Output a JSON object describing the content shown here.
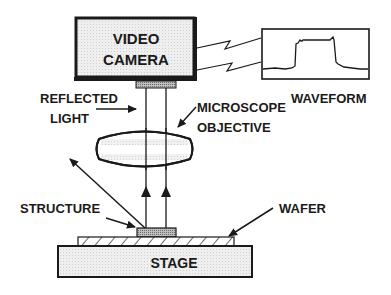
{
  "diagram": {
    "components": {
      "camera": {
        "line1": "VIDEO",
        "line2": "CAMERA"
      },
      "waveform": {
        "label": "WAVEFORM"
      },
      "reflected_light": {
        "line1": "REFLECTED",
        "line2": "LIGHT"
      },
      "objective": {
        "line1": "MICROSCOPE",
        "line2": "OBJECTIVE"
      },
      "structure": {
        "label": "STRUCTURE"
      },
      "wafer": {
        "label": "WAFER"
      },
      "stage": {
        "label": "STAGE"
      }
    },
    "colors": {
      "stroke": "#1a1a1a",
      "fill_light": "#e8e8e8",
      "fill_structure": "#a8a8a8"
    }
  }
}
